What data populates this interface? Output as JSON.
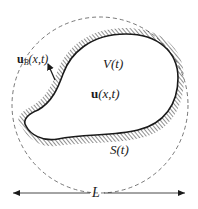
{
  "diagram": {
    "labels": {
      "boundary_velocity": {
        "symbol": "u",
        "subscript": "B",
        "args": "(x,t)"
      },
      "volume": "V(t)",
      "velocity_field": {
        "symbol": "u",
        "args": "(x,t)"
      },
      "surface": "S(t)",
      "length_scale": "L"
    },
    "colors": {
      "stroke": "#1a1a1a",
      "hatch": "#333333",
      "dashed_circle": "#555555",
      "background": "#ffffff"
    }
  }
}
